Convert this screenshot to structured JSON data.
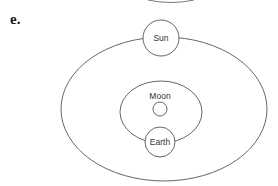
{
  "figure": {
    "part_label": "e.",
    "nodes": {
      "sun": {
        "label": "Sun"
      },
      "moon": {
        "label": "Moon"
      },
      "earth": {
        "label": "Earth"
      }
    },
    "colors": {
      "stroke": "#555555",
      "background": "#ffffff",
      "text": "#333333"
    }
  }
}
